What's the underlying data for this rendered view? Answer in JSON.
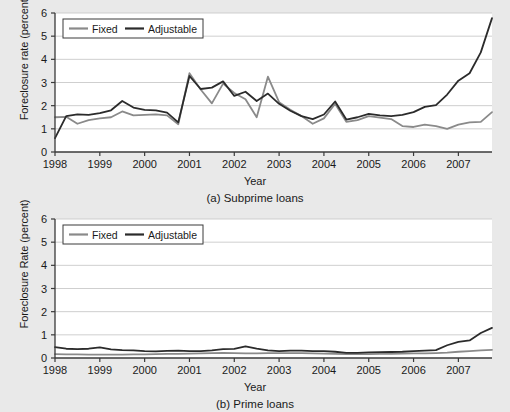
{
  "figure": {
    "background_color": "#e9e9e9",
    "plot_background_color": "#ffffff",
    "grid_color": "#c9c9c9",
    "axis_color": "#3a3a3a"
  },
  "series_colors": {
    "fixed": "#8a8a8a",
    "adjustable": "#2b2b2b"
  },
  "legend": {
    "fixed_label": "Fixed",
    "adjustable_label": "Adjustable"
  },
  "panel_a": {
    "caption": "(a) Subprime loans",
    "ylabel": "Foreclosure rate (percent)",
    "xlabel": "Year"
  },
  "panel_b": {
    "caption": "(b) Prime loans",
    "ylabel": "Foreclosure Rate (percent)",
    "xlabel": "Year"
  },
  "chart_data": [
    {
      "type": "line",
      "title": "(a) Subprime loans",
      "xlabel": "Year",
      "ylabel": "Foreclosure rate (percent)",
      "xlim": [
        1998.0,
        2007.75
      ],
      "ylim": [
        0,
        6
      ],
      "yticks": [
        0,
        1,
        2,
        3,
        4,
        5,
        6
      ],
      "ytick_labels": [
        "0",
        "1",
        "2",
        "3",
        "4",
        "5",
        "6"
      ],
      "xticks": [
        1998,
        1999,
        2000,
        2001,
        2002,
        2003,
        2004,
        2005,
        2006,
        2007
      ],
      "xtick_labels": [
        "1998",
        "1999",
        "2000",
        "2001",
        "2002",
        "2003",
        "2004",
        "2005",
        "2006",
        "2007"
      ],
      "grid": "horizontal",
      "legend_position": "upper-left",
      "x": [
        1998.0,
        1998.25,
        1998.5,
        1998.75,
        1999.0,
        1999.25,
        1999.5,
        1999.75,
        2000.0,
        2000.25,
        2000.5,
        2000.75,
        2001.0,
        2001.25,
        2001.5,
        2001.75,
        2002.0,
        2002.25,
        2002.5,
        2002.75,
        2003.0,
        2003.25,
        2003.5,
        2003.75,
        2004.0,
        2004.25,
        2004.5,
        2004.75,
        2005.0,
        2005.25,
        2005.5,
        2005.75,
        2006.0,
        2006.25,
        2006.5,
        2006.75,
        2007.0,
        2007.25,
        2007.5,
        2007.75
      ],
      "series": [
        {
          "name": "Fixed",
          "color": "#8a8a8a",
          "values": [
            1.5,
            1.52,
            1.22,
            1.38,
            1.45,
            1.5,
            1.75,
            1.58,
            1.6,
            1.62,
            1.58,
            1.2,
            3.4,
            2.7,
            2.1,
            2.95,
            2.55,
            2.28,
            1.5,
            3.25,
            2.15,
            1.82,
            1.55,
            1.22,
            1.45,
            2.08,
            1.3,
            1.38,
            1.55,
            1.48,
            1.42,
            1.12,
            1.08,
            1.18,
            1.12,
            1.0,
            1.18,
            1.28,
            1.3,
            1.72
          ]
        },
        {
          "name": "Adjustable",
          "color": "#2b2b2b",
          "values": [
            0.6,
            1.55,
            1.62,
            1.6,
            1.68,
            1.8,
            2.2,
            1.92,
            1.82,
            1.8,
            1.7,
            1.28,
            3.28,
            2.72,
            2.78,
            3.05,
            2.42,
            2.6,
            2.2,
            2.52,
            2.08,
            1.78,
            1.55,
            1.42,
            1.62,
            2.18,
            1.4,
            1.5,
            1.65,
            1.58,
            1.55,
            1.6,
            1.72,
            1.95,
            2.02,
            2.48,
            3.08,
            3.4,
            4.3,
            5.78
          ]
        }
      ]
    },
    {
      "type": "line",
      "title": "(b) Prime loans",
      "xlabel": "Year",
      "ylabel": "Foreclosure Rate (percent)",
      "xlim": [
        1998.0,
        2007.75
      ],
      "ylim": [
        0,
        6
      ],
      "yticks": [
        0,
        1,
        2,
        3,
        4,
        5,
        6
      ],
      "ytick_labels": [
        "0",
        "1",
        "2",
        "3",
        "4",
        "5",
        "6"
      ],
      "xticks": [
        1998,
        1999,
        2000,
        2001,
        2002,
        2003,
        2004,
        2005,
        2006,
        2007
      ],
      "xtick_labels": [
        "1998",
        "1999",
        "2000",
        "2001",
        "2002",
        "2003",
        "2004",
        "2005",
        "2006",
        "2007"
      ],
      "grid": "horizontal",
      "legend_position": "upper-left",
      "x": [
        1998.0,
        1998.25,
        1998.5,
        1998.75,
        1999.0,
        1999.25,
        1999.5,
        1999.75,
        2000.0,
        2000.25,
        2000.5,
        2000.75,
        2001.0,
        2001.25,
        2001.5,
        2001.75,
        2002.0,
        2002.25,
        2002.5,
        2002.75,
        2003.0,
        2003.25,
        2003.5,
        2003.75,
        2004.0,
        2004.25,
        2004.5,
        2004.75,
        2005.0,
        2005.25,
        2005.5,
        2005.75,
        2006.0,
        2006.25,
        2006.5,
        2006.75,
        2007.0,
        2007.25,
        2007.5,
        2007.75
      ],
      "series": [
        {
          "name": "Fixed",
          "color": "#8a8a8a",
          "values": [
            0.17,
            0.16,
            0.16,
            0.15,
            0.15,
            0.15,
            0.15,
            0.16,
            0.16,
            0.17,
            0.18,
            0.18,
            0.19,
            0.2,
            0.21,
            0.22,
            0.21,
            0.2,
            0.2,
            0.21,
            0.21,
            0.21,
            0.21,
            0.2,
            0.19,
            0.18,
            0.17,
            0.17,
            0.17,
            0.18,
            0.18,
            0.19,
            0.2,
            0.2,
            0.21,
            0.23,
            0.27,
            0.3,
            0.33,
            0.35
          ]
        },
        {
          "name": "Adjustable",
          "color": "#2b2b2b",
          "values": [
            0.47,
            0.4,
            0.38,
            0.4,
            0.46,
            0.37,
            0.34,
            0.33,
            0.3,
            0.29,
            0.31,
            0.32,
            0.3,
            0.3,
            0.33,
            0.38,
            0.39,
            0.5,
            0.4,
            0.33,
            0.3,
            0.32,
            0.32,
            0.3,
            0.3,
            0.27,
            0.22,
            0.22,
            0.24,
            0.25,
            0.26,
            0.27,
            0.3,
            0.32,
            0.34,
            0.55,
            0.7,
            0.76,
            1.08,
            1.3
          ]
        }
      ]
    }
  ]
}
